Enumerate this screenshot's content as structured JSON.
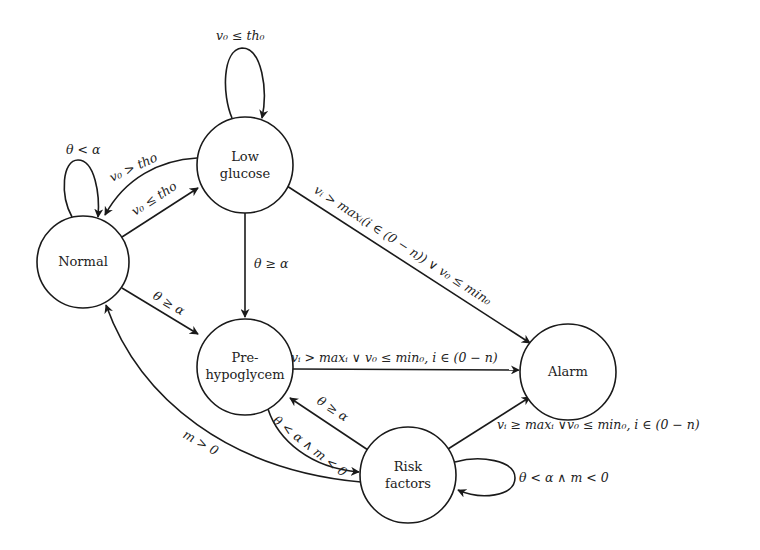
{
  "diagram": {
    "type": "state-machine",
    "nodes": {
      "normal": {
        "lines": [
          "Normal"
        ]
      },
      "low_glucose": {
        "lines": [
          "Low",
          "glucose"
        ]
      },
      "pre_hypo": {
        "lines": [
          "Pre-",
          "hypoglycem"
        ]
      },
      "alarm": {
        "lines": [
          "Alarm"
        ]
      },
      "risk": {
        "lines": [
          "Risk",
          "factors"
        ]
      }
    },
    "edges": {
      "low_self": {
        "from": "Low glucose",
        "to": "Low glucose",
        "label": "v₀ ≤ th₀"
      },
      "normal_self": {
        "from": "Normal",
        "to": "Normal",
        "label": "θ < α"
      },
      "low_to_normal": {
        "from": "Low glucose",
        "to": "Normal",
        "label": "v₀ > tho"
      },
      "normal_to_low": {
        "from": "Normal",
        "to": "Low glucose",
        "label": "v₀ ≤ tho"
      },
      "low_to_pre": {
        "from": "Low glucose",
        "to": "Pre-hypoglycem",
        "label": "θ ≥ α"
      },
      "low_to_alarm": {
        "from": "Low glucose",
        "to": "Alarm",
        "label": "vᵢ > maxᵢ(i ∈ (0 − n)) ∨ v₀ ≤ min₀"
      },
      "normal_to_pre": {
        "from": "Normal",
        "to": "Pre-hypoglycem",
        "label": "θ ≥ α"
      },
      "pre_to_alarm": {
        "from": "Pre-hypoglycem",
        "to": "Alarm",
        "label": "vᵢ > maxᵢ ∨ v₀ ≤ min₀, i ∈ (0 − n)"
      },
      "risk_to_pre": {
        "from": "Risk factors",
        "to": "Pre-hypoglycem",
        "label": "θ ≥ α"
      },
      "pre_to_risk": {
        "from": "Pre-hypoglycem",
        "to": "Risk factors",
        "label": "θ < α ∧ m < 0"
      },
      "risk_to_normal": {
        "from": "Risk factors",
        "to": "Normal",
        "label": "m > 0"
      },
      "risk_to_alarm": {
        "from": "Risk factors",
        "to": "Alarm",
        "label": "vᵢ ≥ maxᵢ ∨v₀ ≤ min₀, i ∈ (0 − n)"
      },
      "risk_self": {
        "from": "Risk factors",
        "to": "Risk factors",
        "label": "θ < α ∧ m < 0"
      }
    }
  }
}
